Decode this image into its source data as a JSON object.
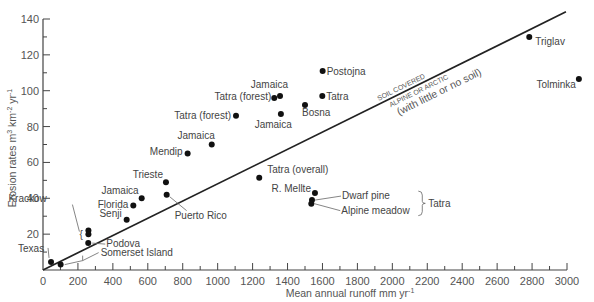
{
  "chart_data": {
    "type": "scatter",
    "title": "",
    "xlabel": "Mean annual runoff mm yr",
    "xlabel_sup": "-1",
    "ylabel": "Erosion rates m",
    "ylabel_parts": [
      "Erosion rates m",
      "3",
      " km",
      "-2",
      " yr",
      "-1"
    ],
    "xlim": [
      0,
      3000
    ],
    "ylim": [
      0,
      140
    ],
    "x_ticks": [
      0,
      200,
      400,
      600,
      800,
      1000,
      1200,
      1400,
      1600,
      1800,
      2000,
      2200,
      2400,
      2600,
      2800,
      3000
    ],
    "y_ticks": [
      20,
      40,
      60,
      80,
      100,
      120,
      140
    ],
    "grid": false,
    "points": [
      {
        "label": "Texas",
        "x": 46,
        "y": 4.5
      },
      {
        "label": "Somerset Island",
        "x": 101,
        "y": 3
      },
      {
        "label": "Krackow",
        "x": 260,
        "y": 22
      },
      {
        "label": "",
        "x": 260,
        "y": 20
      },
      {
        "label": "Podova",
        "x": 259,
        "y": 15
      },
      {
        "label": "Senji",
        "x": 479,
        "y": 28
      },
      {
        "label": "Florida",
        "x": 517,
        "y": 36
      },
      {
        "label": "Jamaica",
        "x": 565,
        "y": 40
      },
      {
        "label": "Trieste",
        "x": 704,
        "y": 49
      },
      {
        "label": "Puerto Rico",
        "x": 708,
        "y": 42
      },
      {
        "label": "Mendip",
        "x": 828,
        "y": 65
      },
      {
        "label": "Jamaica",
        "x": 966,
        "y": 70
      },
      {
        "label": "Tatra (forest)",
        "x": 1105,
        "y": 86
      },
      {
        "label": "Tatra (overall)",
        "x": 1238,
        "y": 51.5
      },
      {
        "label": "Tatra (forest)",
        "x": 1324,
        "y": 96
      },
      {
        "label": "Jamaica",
        "x": 1357,
        "y": 97
      },
      {
        "label": "Jamaica",
        "x": 1362,
        "y": 87
      },
      {
        "label": "Bosna",
        "x": 1500,
        "y": 92
      },
      {
        "label": "Postojna",
        "x": 1601,
        "y": 111
      },
      {
        "label": "Tatra",
        "x": 1599,
        "y": 97
      },
      {
        "label": "R. Mellte",
        "x": 1557,
        "y": 43
      },
      {
        "label": "Dwarf pine",
        "x": 1540,
        "y": 39
      },
      {
        "label": "Alpine meadow",
        "x": 1536,
        "y": 37
      },
      {
        "label": "Triglav",
        "x": 2784,
        "y": 130
      },
      {
        "label": "Tolminka",
        "x": 3068,
        "y": 106.5
      }
    ],
    "threshold_line": {
      "x": [
        0,
        2994
      ],
      "y": [
        0,
        144
      ]
    },
    "annotations": {
      "above_line": "SOIL COVERED",
      "below_line_1": "ALPINE OR ARCTIC",
      "below_line_2": "(with little or no soil)",
      "group_label": "Tatra"
    }
  }
}
